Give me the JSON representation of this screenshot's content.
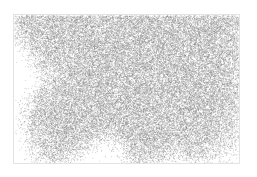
{
  "figure": {
    "title": "",
    "subtitle": "",
    "frame": {
      "x": 13,
      "y": 14,
      "width": 227,
      "height": 150,
      "border_color": "#e3e3e6",
      "background": "#ffffff"
    }
  },
  "chart_data": {
    "type": "scatter",
    "title": "",
    "subtitle": "",
    "xlabel": "",
    "ylabel": "",
    "xlim": [
      0,
      227
    ],
    "ylim": [
      0,
      150
    ],
    "grid": false,
    "legend": null,
    "annotations": [],
    "tick_labels": {
      "x": [],
      "y": []
    },
    "point_style": {
      "marker": "point",
      "size_px": 0.8,
      "color": "#8c8c8c",
      "alpha": 0.55
    },
    "point_count_approx": 46000,
    "density_field": {
      "comment": "Normalized 0..1 density sampled on a coarse grid across the plot area; 0 = empty sea, 1 = densest land.",
      "cols": 24,
      "rows": 16,
      "values": [
        [
          0.55,
          0.8,
          0.88,
          0.92,
          0.9,
          0.92,
          0.94,
          0.93,
          0.92,
          0.94,
          0.95,
          0.94,
          0.93,
          0.94,
          0.95,
          0.94,
          0.93,
          0.92,
          0.93,
          0.94,
          0.93,
          0.9,
          0.85,
          0.6
        ],
        [
          0.5,
          0.78,
          0.86,
          0.9,
          0.92,
          0.93,
          0.94,
          0.95,
          0.94,
          0.95,
          0.96,
          0.95,
          0.94,
          0.95,
          0.96,
          0.95,
          0.94,
          0.93,
          0.94,
          0.95,
          0.94,
          0.91,
          0.84,
          0.58
        ],
        [
          0.3,
          0.62,
          0.82,
          0.88,
          0.91,
          0.93,
          0.94,
          0.95,
          0.95,
          0.96,
          0.96,
          0.95,
          0.95,
          0.96,
          0.96,
          0.95,
          0.95,
          0.94,
          0.95,
          0.96,
          0.95,
          0.92,
          0.85,
          0.58
        ],
        [
          0.1,
          0.35,
          0.7,
          0.85,
          0.9,
          0.92,
          0.94,
          0.95,
          0.95,
          0.96,
          0.96,
          0.96,
          0.95,
          0.96,
          0.96,
          0.96,
          0.95,
          0.95,
          0.95,
          0.96,
          0.95,
          0.92,
          0.85,
          0.57
        ],
        [
          0.02,
          0.08,
          0.42,
          0.78,
          0.88,
          0.91,
          0.93,
          0.95,
          0.95,
          0.96,
          0.96,
          0.96,
          0.96,
          0.96,
          0.96,
          0.96,
          0.96,
          0.95,
          0.95,
          0.96,
          0.95,
          0.92,
          0.84,
          0.55
        ],
        [
          0.0,
          0.02,
          0.2,
          0.55,
          0.82,
          0.9,
          0.93,
          0.94,
          0.95,
          0.96,
          0.96,
          0.96,
          0.96,
          0.96,
          0.96,
          0.96,
          0.96,
          0.95,
          0.95,
          0.96,
          0.95,
          0.92,
          0.84,
          0.54
        ],
        [
          0.0,
          0.0,
          0.1,
          0.3,
          0.5,
          0.8,
          0.9,
          0.93,
          0.95,
          0.96,
          0.96,
          0.96,
          0.96,
          0.96,
          0.96,
          0.96,
          0.95,
          0.95,
          0.95,
          0.96,
          0.95,
          0.92,
          0.83,
          0.52
        ],
        [
          0.0,
          0.0,
          0.05,
          0.45,
          0.7,
          0.85,
          0.92,
          0.94,
          0.95,
          0.96,
          0.96,
          0.95,
          0.95,
          0.96,
          0.96,
          0.95,
          0.95,
          0.95,
          0.95,
          0.95,
          0.94,
          0.91,
          0.82,
          0.5
        ],
        [
          0.0,
          0.02,
          0.3,
          0.72,
          0.88,
          0.92,
          0.94,
          0.95,
          0.95,
          0.96,
          0.96,
          0.95,
          0.95,
          0.95,
          0.95,
          0.95,
          0.95,
          0.94,
          0.95,
          0.95,
          0.94,
          0.9,
          0.8,
          0.48
        ],
        [
          0.0,
          0.1,
          0.55,
          0.85,
          0.91,
          0.93,
          0.94,
          0.95,
          0.95,
          0.95,
          0.95,
          0.95,
          0.95,
          0.95,
          0.95,
          0.95,
          0.94,
          0.94,
          0.94,
          0.95,
          0.93,
          0.89,
          0.78,
          0.46
        ],
        [
          0.0,
          0.22,
          0.7,
          0.88,
          0.92,
          0.93,
          0.94,
          0.95,
          0.95,
          0.95,
          0.94,
          0.94,
          0.94,
          0.95,
          0.95,
          0.94,
          0.94,
          0.93,
          0.94,
          0.94,
          0.92,
          0.88,
          0.76,
          0.44
        ],
        [
          0.0,
          0.25,
          0.72,
          0.88,
          0.92,
          0.93,
          0.93,
          0.94,
          0.93,
          0.92,
          0.9,
          0.92,
          0.94,
          0.94,
          0.94,
          0.94,
          0.93,
          0.92,
          0.93,
          0.93,
          0.9,
          0.84,
          0.7,
          0.4
        ],
        [
          0.0,
          0.18,
          0.62,
          0.84,
          0.9,
          0.91,
          0.9,
          0.88,
          0.8,
          0.62,
          0.55,
          0.75,
          0.9,
          0.93,
          0.93,
          0.92,
          0.9,
          0.88,
          0.9,
          0.9,
          0.85,
          0.76,
          0.58,
          0.3
        ],
        [
          0.0,
          0.08,
          0.45,
          0.75,
          0.86,
          0.86,
          0.78,
          0.58,
          0.3,
          0.12,
          0.18,
          0.5,
          0.8,
          0.88,
          0.88,
          0.85,
          0.78,
          0.7,
          0.8,
          0.82,
          0.72,
          0.58,
          0.38,
          0.16
        ],
        [
          0.0,
          0.02,
          0.2,
          0.52,
          0.7,
          0.66,
          0.45,
          0.2,
          0.06,
          0.02,
          0.04,
          0.22,
          0.58,
          0.72,
          0.7,
          0.6,
          0.45,
          0.36,
          0.55,
          0.6,
          0.45,
          0.3,
          0.16,
          0.05
        ],
        [
          0.0,
          0.0,
          0.05,
          0.22,
          0.36,
          0.28,
          0.14,
          0.04,
          0.0,
          0.0,
          0.0,
          0.05,
          0.25,
          0.38,
          0.34,
          0.24,
          0.14,
          0.1,
          0.22,
          0.26,
          0.16,
          0.08,
          0.03,
          0.0
        ]
      ]
    },
    "coast_voids": [
      {
        "name": "upper-left-bay",
        "x": 0,
        "y": 18,
        "width": 52,
        "height": 52
      },
      {
        "name": "diagonal-estuary",
        "x": 44,
        "y": 48,
        "width": 34,
        "height": 34
      },
      {
        "name": "southern-sea",
        "x": 0,
        "y": 126,
        "width": 227,
        "height": 24
      }
    ]
  }
}
